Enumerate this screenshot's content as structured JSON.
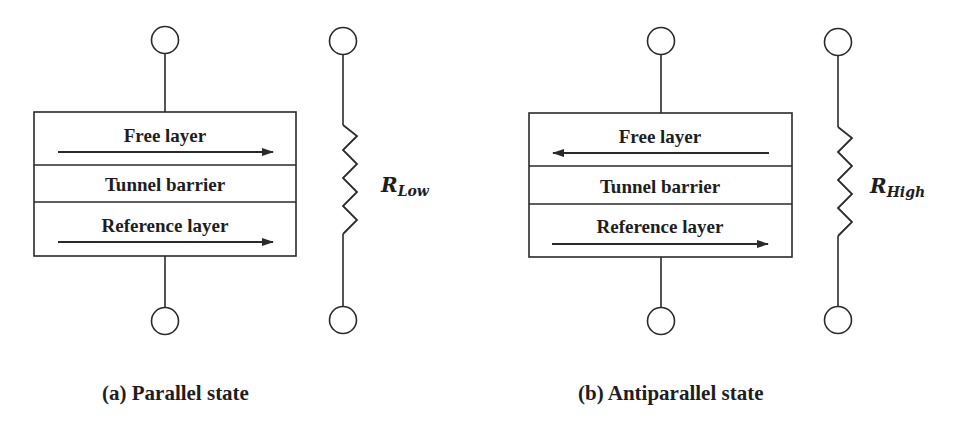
{
  "panels": [
    {
      "id": "a",
      "caption": "(a) Parallel state",
      "layers": {
        "free": "Free layer",
        "barrier": "Tunnel barrier",
        "reference": "Reference layer"
      },
      "free_arrow_direction": "right",
      "reference_arrow_direction": "right",
      "resistor": {
        "symbol": "R",
        "subscript": "Low"
      }
    },
    {
      "id": "b",
      "caption": "(b) Antiparallel state",
      "layers": {
        "free": "Free layer",
        "barrier": "Tunnel barrier",
        "reference": "Reference layer"
      },
      "free_arrow_direction": "left",
      "reference_arrow_direction": "right",
      "resistor": {
        "symbol": "R",
        "subscript": "High"
      }
    }
  ],
  "colors": {
    "line": "#2a2a2a",
    "text": "#1e1e1e",
    "background": "#ffffff"
  }
}
